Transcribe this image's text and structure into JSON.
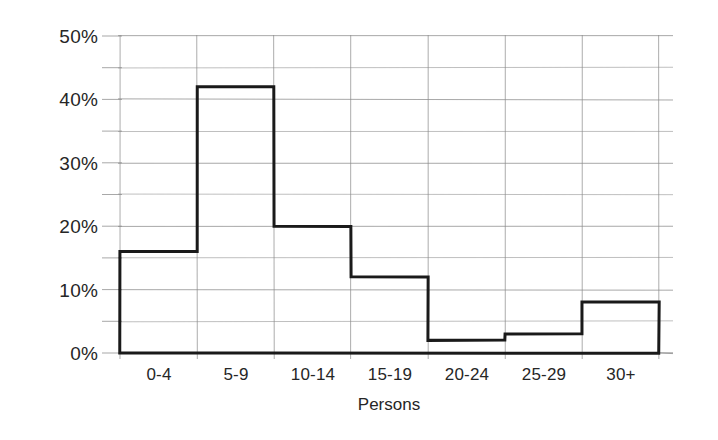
{
  "chart_data": {
    "type": "bar",
    "title": "",
    "subtitle": "",
    "xlabel": "Persons",
    "ylabel": "",
    "categories": [
      "0-4",
      "5-9",
      "10-14",
      "15-19",
      "20-24",
      "25-29",
      "30+"
    ],
    "values": [
      16,
      42,
      20,
      12,
      2,
      3,
      8
    ],
    "value_suffix": "%",
    "ylim": [
      0,
      50
    ],
    "xlim": [
      0,
      7
    ],
    "ytick_values": [
      0,
      10,
      20,
      30,
      40,
      50
    ],
    "ytick_labels": [
      "0%",
      "10%",
      "20%",
      "30%",
      "40%",
      "50%"
    ],
    "yminor_tick_values": [
      5,
      15,
      25,
      35,
      45
    ],
    "grid": {
      "horizontal": true,
      "vertical": true,
      "minor_horizontal": true,
      "color": "#8c8c8c"
    },
    "legend": {
      "visible": false,
      "position": "none",
      "entries": []
    },
    "style": "hand-drawn-step-histogram",
    "series": [
      {
        "name": "Share of households",
        "values": [
          16,
          42,
          20,
          12,
          2,
          3,
          8
        ]
      }
    ],
    "annotations": []
  },
  "colors": {
    "line": "#1a1a1a",
    "grid": "#8c8c8c",
    "axis": "#1a1a1a",
    "background": "#ffffff",
    "text": "#262626"
  },
  "geometry": {
    "plot_left": 120,
    "plot_right": 659,
    "plot_top": 36,
    "plot_bottom": 353,
    "band_width": 77
  }
}
